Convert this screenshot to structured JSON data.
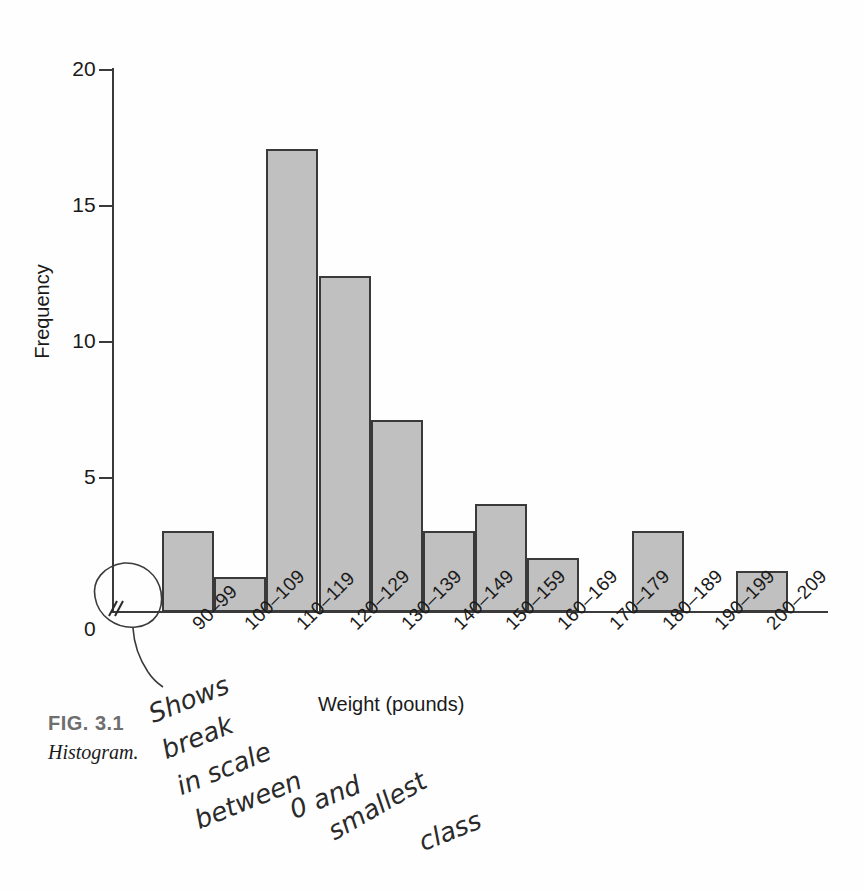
{
  "figure": {
    "number": "FIG. 3.1",
    "title": "Histogram."
  },
  "chart_data": {
    "type": "bar",
    "title": "",
    "xlabel": "Weight (pounds)",
    "ylabel": "Frequency",
    "categories": [
      "90–99",
      "100–109",
      "110–119",
      "120–129",
      "130–139",
      "140–149",
      "150–159",
      "160–169",
      "170–179",
      "180–189",
      "190–199",
      "200–209"
    ],
    "values": [
      3,
      1.3,
      17.1,
      12.4,
      7.1,
      3,
      4,
      2,
      0,
      3,
      0,
      1.5
    ],
    "ylim": [
      0,
      20
    ],
    "ytick_labels": [
      "20",
      "15",
      "10",
      "5",
      "0"
    ],
    "ytick_values": [
      20,
      15,
      10,
      5,
      0
    ],
    "grid": false,
    "legend": "none",
    "bar_fill_color": "#c0c0c0",
    "bar_border_color": "#3a3a3a",
    "axis_color": "#3a3a3a",
    "scale_break": "scale-break-symbol"
  },
  "annotation": {
    "words": [
      "Shows",
      "break",
      "in scale",
      "between",
      "0 and",
      "smallest",
      "class"
    ],
    "full_text": "Shows break in scale between 0 and smallest class"
  }
}
